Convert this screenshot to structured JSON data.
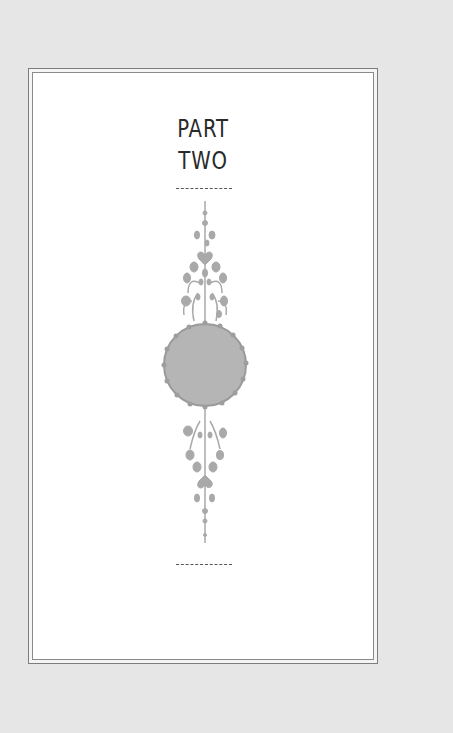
{
  "page": {
    "heading_line1": "PART",
    "heading_line2": "TWO",
    "ornament": "floral-medallion-ornament",
    "colors": {
      "background": "#e6e6e6",
      "page": "#ffffff",
      "frame": "#7d7d7d",
      "text": "#2a2a2a",
      "ornament": "#a8a8a8"
    }
  }
}
